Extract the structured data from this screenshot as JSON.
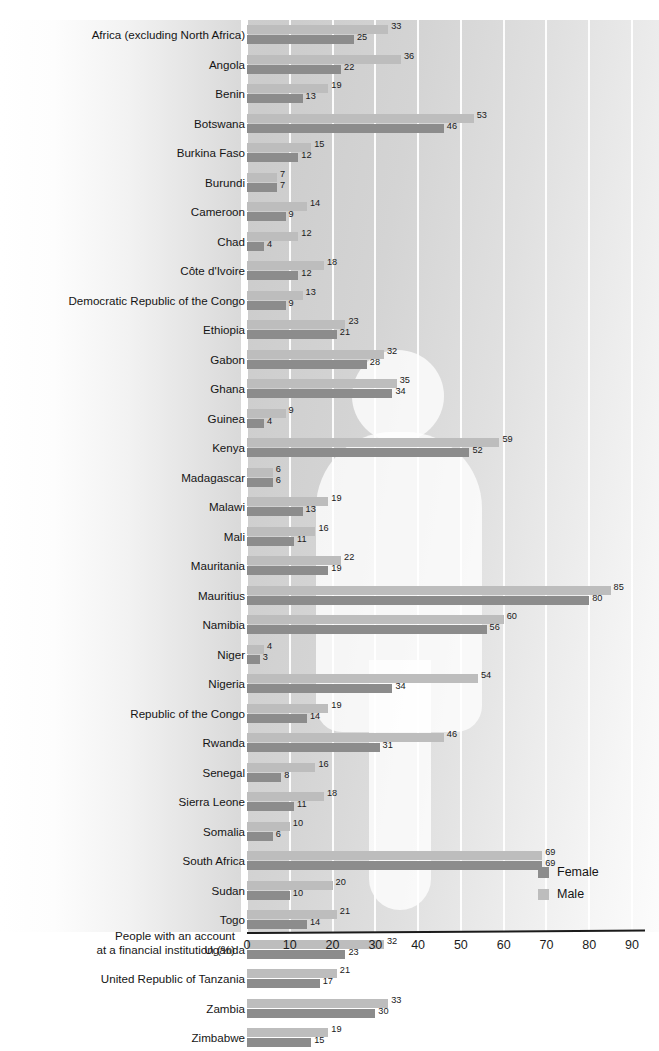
{
  "figure": {
    "cut_off_title": "",
    "axis_caption_line1": "People with an account",
    "axis_caption_line2": "at a financial institution (%)"
  },
  "legend": {
    "position": "bottom-right",
    "entries": [
      {
        "label": "Female",
        "color": "#8c8c8c"
      },
      {
        "label": "Male",
        "color": "#bdbdbd"
      }
    ]
  },
  "colors": {
    "female": "#8c8c8c",
    "male": "#bdbdbd",
    "gridline": "#ffffff",
    "axis": "#1b1b1b",
    "plot_background": "#d0d0d0"
  },
  "chart_data": {
    "type": "bar",
    "orientation": "horizontal",
    "grouped": true,
    "title": "",
    "xlabel": "People with an account at a financial institution (%)",
    "ylabel": "",
    "xlim": [
      0,
      90
    ],
    "xticks": [
      0,
      10,
      20,
      30,
      40,
      50,
      60,
      70,
      80,
      90
    ],
    "grid": "vertical",
    "legend_position": "bottom-right",
    "categories": [
      "Africa (excluding North Africa)",
      "Angola",
      "Benin",
      "Botswana",
      "Burkina Faso",
      "Burundi",
      "Cameroon",
      "Chad",
      "Côte d'Ivoire",
      "Democratic Republic of the Congo",
      "Ethiopia",
      "Gabon",
      "Ghana",
      "Guinea",
      "Kenya",
      "Madagascar",
      "Malawi",
      "Mali",
      "Mauritania",
      "Mauritius",
      "Namibia",
      "Niger",
      "Nigeria",
      "Republic of the Congo",
      "Rwanda",
      "Senegal",
      "Sierra Leone",
      "Somalia",
      "South Africa",
      "Sudan",
      "Togo",
      "Uganda",
      "United Republic of Tanzania",
      "Zambia",
      "Zimbabwe"
    ],
    "series": [
      {
        "name": "Male",
        "color": "#bdbdbd",
        "values": [
          33,
          36,
          19,
          53,
          15,
          7,
          14,
          12,
          18,
          13,
          23,
          32,
          35,
          9,
          59,
          6,
          19,
          16,
          22,
          85,
          60,
          4,
          54,
          19,
          46,
          16,
          18,
          10,
          69,
          20,
          21,
          32,
          21,
          33,
          19
        ]
      },
      {
        "name": "Female",
        "color": "#8c8c8c",
        "values": [
          25,
          22,
          13,
          46,
          12,
          7,
          9,
          4,
          12,
          9,
          21,
          28,
          34,
          4,
          52,
          6,
          13,
          11,
          19,
          80,
          56,
          3,
          34,
          14,
          31,
          8,
          11,
          6,
          69,
          10,
          14,
          23,
          17,
          30,
          15
        ]
      }
    ]
  }
}
